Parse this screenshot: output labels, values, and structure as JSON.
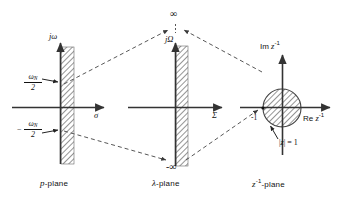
{
  "figure": {
    "colors": {
      "line": "#333333",
      "dashed": "#444444",
      "hatch": "#555555",
      "text": "#111111",
      "background": "#ffffff"
    }
  },
  "planes": [
    {
      "id": "p-plane",
      "name_prefix": "p",
      "name_suffix": "-plane",
      "vertical_axis_label": "jω",
      "horizontal_axis_label": "σ",
      "band_upper_label_num": "ω",
      "band_upper_label_sub": "N",
      "band_upper_label_den": "2",
      "band_lower_sign": "−",
      "band_lower_label_num": "ω",
      "band_lower_label_sub": "N",
      "band_lower_label_den": "2",
      "region": "hatched vertical strip right of jω axis"
    },
    {
      "id": "lambda-plane",
      "name_prefix": "λ",
      "name_suffix": "-plane",
      "vertical_axis_label": "jΩ",
      "horizontal_axis_label": "Σ",
      "top_limit_label": "∞",
      "bottom_limit_label": "-∞",
      "region": "hatched vertical strip right of jΩ axis"
    },
    {
      "id": "z-inverse-plane",
      "name_prefix": "z",
      "name_superscript": "-1",
      "name_suffix": "-plane",
      "vertical_axis_label_rm": "Im ",
      "vertical_axis_label_var": "z",
      "vertical_axis_label_sup": "-1",
      "horizontal_axis_label_rm": "Re ",
      "horizontal_axis_label_var": "z",
      "horizontal_axis_label_sup": "-1",
      "point_label": "-1",
      "circle_label_open": "|",
      "circle_label_var": "z",
      "circle_label_close": "| = 1",
      "region": "hatched unit disk centered at origin"
    }
  ],
  "annotations": {
    "infinity_top": "∞",
    "infinity_bottom": "-∞",
    "unit_circle": "|z| = 1",
    "minus_one": "-1"
  }
}
